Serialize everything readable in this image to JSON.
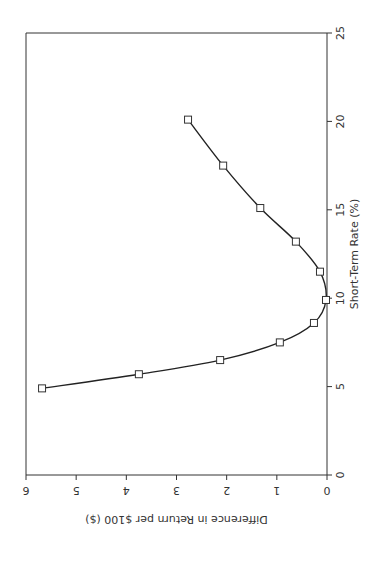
{
  "chart_data": {
    "type": "line",
    "title": "",
    "xlabel": "Short-Term Rate (%)",
    "ylabel": "Difference in Return per $100 ($)",
    "xlim": [
      0,
      25
    ],
    "ylim": [
      0,
      6
    ],
    "x_ticks": [
      0,
      5,
      10,
      15,
      20,
      25
    ],
    "y_ticks": [
      0,
      1,
      2,
      3,
      4,
      5,
      6
    ],
    "grid": false,
    "legend": null,
    "orientation": "rotated 90 degrees clockwise (x-axis vertical on right, y-axis horizontal at bottom, text upside-down)",
    "marker": "open-square",
    "series": [
      {
        "name": "Difference in Return",
        "x": [
          4.9,
          5.7,
          6.5,
          7.5,
          8.6,
          9.9,
          11.5,
          13.2,
          15.1,
          17.5,
          20.1
        ],
        "y": [
          5.68,
          3.75,
          2.13,
          0.94,
          0.26,
          0.02,
          0.14,
          0.62,
          1.33,
          2.07,
          2.77
        ]
      }
    ]
  },
  "layout": {
    "plot_left_px": 26,
    "plot_right_px": 327,
    "plot_top_px": 33,
    "plot_bottom_px": 475,
    "line_color": "#222222",
    "axis_color": "#333333"
  }
}
